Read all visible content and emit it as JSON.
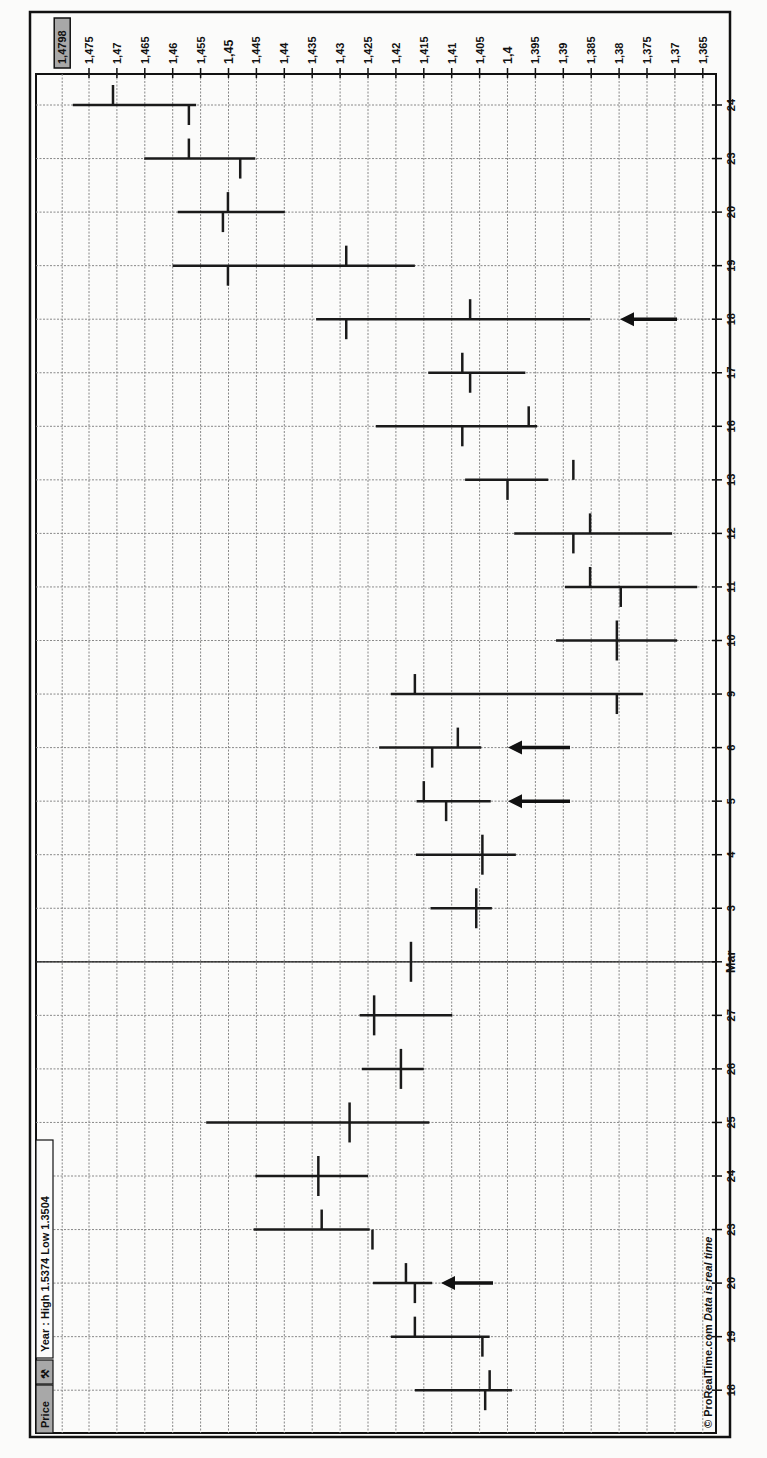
{
  "chart_data": {
    "type": "ohlc",
    "orientation": "rotated-90-clockwise",
    "title": "Price",
    "subtitle": "Year : High 1.5374 Low 1.3504",
    "footer": "© ProRealTime.com",
    "footer_note": "Data is real time",
    "current_price_label": "1,4798",
    "price_axis": {
      "ticks": [
        "1,475",
        "1,47",
        "1,465",
        "1,46",
        "1,455",
        "1,45",
        "1,445",
        "1,44",
        "1,435",
        "1,43",
        "1,425",
        "1,42",
        "1,415",
        "1,41",
        "1,405",
        "1,4",
        "1,395",
        "1,39",
        "1,385",
        "1,38",
        "1,375",
        "1,37",
        "1,365"
      ],
      "bold_ticks": [
        "1,45",
        "1,4"
      ],
      "range": [
        1.3635,
        1.4798
      ]
    },
    "date_axis": {
      "labels": [
        "18",
        "19",
        "20",
        "23",
        "24",
        "25",
        "26",
        "27",
        "Mar",
        "3",
        "4",
        "5",
        "6",
        "9",
        "10",
        "11",
        "12",
        "13",
        "16",
        "17",
        "18",
        "19",
        "20",
        "23",
        "24"
      ],
      "bold_labels": [
        "Mar"
      ]
    },
    "bars": [
      {
        "date": "18",
        "open": 1.4032,
        "high": 1.4166,
        "low": 1.3992,
        "close": 1.404
      },
      {
        "date": "19",
        "open": 1.4166,
        "high": 1.4209,
        "low": 1.4032,
        "close": 1.4045
      },
      {
        "date": "20",
        "open": 1.4182,
        "high": 1.4241,
        "low": 1.4135,
        "close": 1.4166
      },
      {
        "date": "23",
        "open": 1.4333,
        "high": 1.4455,
        "low": 1.4247,
        "close": 1.4242
      },
      {
        "date": "24",
        "open": 1.4339,
        "high": 1.4452,
        "low": 1.425,
        "close": 1.4339
      },
      {
        "date": "25",
        "open": 1.4283,
        "high": 1.454,
        "low": 1.414,
        "close": 1.4283
      },
      {
        "date": "26",
        "open": 1.4191,
        "high": 1.4261,
        "low": 1.415,
        "close": 1.4191
      },
      {
        "date": "27",
        "open": 1.4239,
        "high": 1.4265,
        "low": 1.4099,
        "close": 1.4239
      },
      {
        "date": "Mar",
        "open": 1.4173,
        "high": 1.4173,
        "low": 1.4173,
        "close": 1.4173
      },
      {
        "date": "3",
        "open": 1.4056,
        "high": 1.4138,
        "low": 1.4028,
        "close": 1.4056
      },
      {
        "date": "4",
        "open": 1.4045,
        "high": 1.4164,
        "low": 1.3985,
        "close": 1.4045
      },
      {
        "date": "5",
        "open": 1.415,
        "high": 1.4163,
        "low": 1.403,
        "close": 1.411
      },
      {
        "date": "6",
        "open": 1.4089,
        "high": 1.423,
        "low": 1.4047,
        "close": 1.4135
      },
      {
        "date": "9",
        "open": 1.4166,
        "high": 1.4209,
        "low": 1.3757,
        "close": 1.3804
      },
      {
        "date": "10",
        "open": 1.3804,
        "high": 1.3913,
        "low": 1.3696,
        "close": 1.3804
      },
      {
        "date": "11",
        "open": 1.3852,
        "high": 1.3897,
        "low": 1.366,
        "close": 1.3797
      },
      {
        "date": "12",
        "open": 1.3852,
        "high": 1.3988,
        "low": 1.3705,
        "close": 1.3882
      },
      {
        "date": "13",
        "open": 1.3882,
        "high": 1.4076,
        "low": 1.3927,
        "close": 1.4
      },
      {
        "date": "16",
        "open": 1.3962,
        "high": 1.4236,
        "low": 1.3947,
        "close": 1.4081
      },
      {
        "date": "17",
        "open": 1.4081,
        "high": 1.4142,
        "low": 1.3968,
        "close": 1.4067
      },
      {
        "date": "18",
        "open": 1.4067,
        "high": 1.4343,
        "low": 1.3852,
        "close": 1.4289
      },
      {
        "date": "19",
        "open": 1.4289,
        "high": 1.46,
        "low": 1.4166,
        "close": 1.4501
      },
      {
        "date": "20",
        "open": 1.4501,
        "high": 1.4591,
        "low": 1.4399,
        "close": 1.451
      },
      {
        "date": "23",
        "open": 1.4571,
        "high": 1.4651,
        "low": 1.4452,
        "close": 1.4479
      },
      {
        "date": "24",
        "open": 1.4707,
        "high": 1.4779,
        "low": 1.4558,
        "close": 1.4571
      }
    ],
    "annotations": [
      {
        "type": "arrow",
        "date_index": 2,
        "label": "arrow-20-feb"
      },
      {
        "type": "arrow",
        "date_index": 11,
        "label": "arrow-5-mar"
      },
      {
        "type": "arrow",
        "date_index": 12,
        "label": "arrow-6-mar"
      },
      {
        "type": "arrow",
        "date_index": 20,
        "label": "arrow-18-mar"
      }
    ]
  },
  "header": {
    "price_tab": "Price",
    "wrench_icon": "wrench-icon",
    "range_text": "Year : High 1.5374 Low 1.3504"
  },
  "footer": {
    "copyright": "© ProRealTime.com",
    "realtime": "Data is real time"
  },
  "colors": {
    "background": "#fbfbfa",
    "line": "#1a1a1a",
    "grid": "#888888",
    "label_box": "#a8a8a8"
  }
}
